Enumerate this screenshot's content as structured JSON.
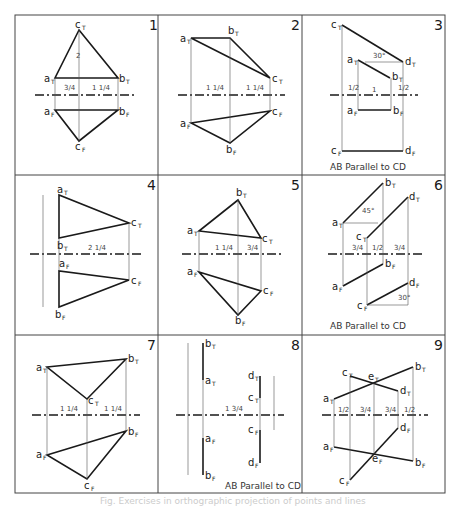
{
  "figure": {
    "panels": [
      {
        "number": "1",
        "labels": [
          "c",
          "a",
          "b",
          "a",
          "b",
          "c"
        ],
        "subs": [
          "T",
          "T",
          "T",
          "F",
          "F",
          "F"
        ],
        "dims": [
          "2",
          "3/4",
          "1 1/4",
          "1/4",
          "1/4",
          "1/4",
          "1/4",
          "1/4"
        ]
      },
      {
        "number": "2",
        "labels": [
          "a",
          "b",
          "c",
          "c",
          "a",
          "b"
        ],
        "subs": [
          "T",
          "T",
          "T",
          "F",
          "F",
          "F"
        ],
        "dims": [
          "1 1/4",
          "1 1/4",
          "1/2",
          "1/2",
          "3/8",
          "1/4",
          "1/4",
          "1/4"
        ]
      },
      {
        "number": "3",
        "labels": [
          "c",
          "a",
          "b",
          "d",
          "a",
          "b",
          "c",
          "d"
        ],
        "subs": [
          "T",
          "T",
          "T",
          "T",
          "F",
          "F",
          "F",
          "F"
        ],
        "dims": [
          "30°",
          "1/2",
          "1",
          "1/2",
          "1/4",
          "1/4",
          "1/2",
          "1/2"
        ],
        "caption": "AB Parallel to CD"
      },
      {
        "number": "4",
        "labels": [
          "a",
          "b",
          "c",
          "a",
          "b",
          "c"
        ],
        "subs": [
          "T",
          "T",
          "T",
          "F",
          "F",
          "F"
        ],
        "dims": [
          "2 1/4",
          "1 3/8",
          "1/4",
          "1/4",
          "7/8",
          "1/2"
        ]
      },
      {
        "number": "5",
        "labels": [
          "b",
          "a",
          "c",
          "a",
          "c",
          "b"
        ],
        "subs": [
          "T",
          "T",
          "T",
          "F",
          "F",
          "F"
        ],
        "dims": [
          "1 1/4",
          "3/4",
          "1/2",
          "1/4",
          "1/2",
          "1/4",
          "2"
        ]
      },
      {
        "number": "6",
        "labels": [
          "b",
          "a",
          "d",
          "c",
          "b",
          "a",
          "d",
          "c"
        ],
        "subs": [
          "T",
          "T",
          "T",
          "T",
          "F",
          "F",
          "F",
          "F"
        ],
        "dims": [
          "45°",
          "3/4",
          "1/2",
          "3/4",
          "30°",
          "1/2",
          "3/8"
        ],
        "caption": "AB Parallel to CD"
      },
      {
        "number": "7",
        "labels": [
          "a",
          "b",
          "c",
          "b",
          "a",
          "c"
        ],
        "subs": [
          "T",
          "T",
          "T",
          "F",
          "F",
          "F"
        ],
        "dims": [
          "1 1/4",
          "1 1/4",
          "1/4",
          "1/2",
          "1/4",
          "1/4",
          "2"
        ]
      },
      {
        "number": "8",
        "labels": [
          "b",
          "a",
          "d",
          "c",
          "a",
          "c",
          "b",
          "d"
        ],
        "subs": [
          "T",
          "T",
          "T",
          "T",
          "F",
          "F",
          "F",
          "F"
        ],
        "dims": [
          "1 3/4",
          "1/2",
          "1/2",
          "3/8",
          "1/4",
          "3/4",
          "1/2",
          "3/8"
        ],
        "caption": "AB Parallel to CD"
      },
      {
        "number": "9",
        "labels": [
          "c",
          "e",
          "b",
          "a",
          "d",
          "d",
          "a",
          "e",
          "b",
          "c"
        ],
        "subs": [
          "T",
          "T",
          "T",
          "T",
          "T",
          "F",
          "F",
          "F",
          "F",
          "F"
        ],
        "dims": [
          "1/2",
          "3/4",
          "3/4",
          "1/2",
          "1/4",
          "1/2",
          "2",
          "1/2"
        ]
      }
    ],
    "footer_caption": "Fig. Exercises in orthographic projection of points and lines"
  }
}
